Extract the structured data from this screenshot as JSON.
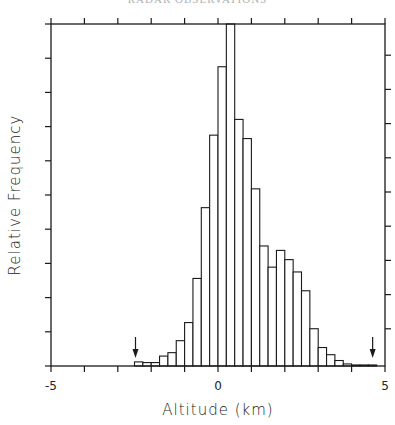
{
  "header": {
    "text": "RADAR OBSERVATIONS"
  },
  "chart_data": {
    "type": "bar",
    "subtype": "histogram",
    "title": "",
    "xlabel": "Altitude (km)",
    "ylabel": "Relative Frequency",
    "xlim": [
      -5,
      5
    ],
    "ylim": [
      0,
      100
    ],
    "x_ticks": [
      -5,
      -4,
      -3,
      -2,
      -1,
      0,
      1,
      2,
      3,
      4,
      5
    ],
    "x_tick_labels": [
      {
        "value": -5,
        "label": "-5"
      },
      {
        "value": 0,
        "label": "0"
      },
      {
        "value": 5,
        "label": "5"
      }
    ],
    "y_tick_labels": [],
    "y_tick_count": 10,
    "grid": false,
    "bin_width": 0.25,
    "bin_edges_start": -2.5,
    "categories": [
      -2.5,
      -2.25,
      -2.0,
      -1.75,
      -1.5,
      -1.25,
      -1.0,
      -0.75,
      -0.5,
      -0.25,
      0.0,
      0.25,
      0.5,
      0.75,
      1.0,
      1.25,
      1.5,
      1.75,
      2.0,
      2.25,
      2.5,
      2.75,
      3.0,
      3.25,
      3.5,
      3.75,
      4.0,
      4.25,
      4.5
    ],
    "values": [
      1.2,
      1.0,
      1.0,
      2.9,
      3.9,
      7.4,
      12.7,
      25.6,
      46.3,
      67.5,
      87.5,
      105,
      72.1,
      66.5,
      51.8,
      35.1,
      28.9,
      33.8,
      31.1,
      27.5,
      22.0,
      10.9,
      5.4,
      3.3,
      1.6,
      0.6,
      0.3,
      0.3,
      0.3
    ],
    "clipped_bins": [
      0.25
    ],
    "annotations": [
      {
        "type": "arrow-down",
        "x": -2.5,
        "label": ""
      },
      {
        "type": "arrow-down",
        "x": 4.6,
        "label": ""
      }
    ],
    "legend": null
  }
}
